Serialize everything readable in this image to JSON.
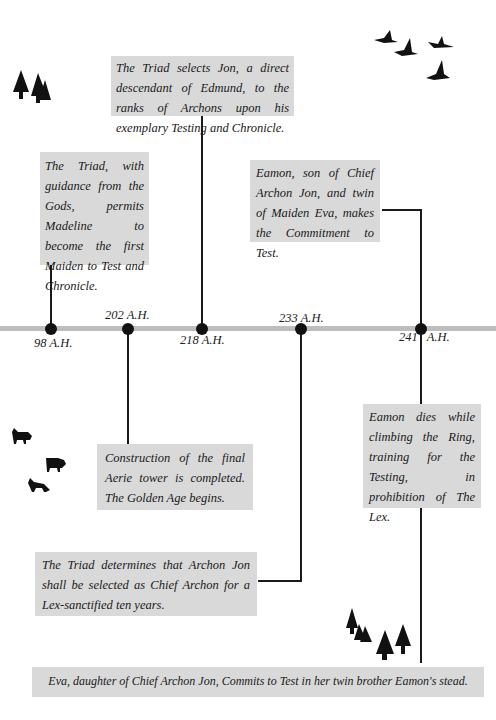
{
  "timeline": {
    "axis_color": "#bdbdbd",
    "box_color": "#d9d9d9",
    "dates": [
      {
        "label": "98 A.H.",
        "x": 51
      },
      {
        "label": "202 A.H.",
        "x": 128
      },
      {
        "label": "218 A.H.",
        "x": 202
      },
      {
        "label": "233 A.H.",
        "x": 301
      },
      {
        "label": "241 A.H.",
        "x": 421
      }
    ],
    "events": [
      {
        "date": "98 A.H.",
        "text": "The Triad, with guidance from the Gods, permits Madeline to become the first Maiden to Test and Chronicle."
      },
      {
        "date": "202 A.H.",
        "text": "Construction of the final Aerie tower is completed. The Golden Age begins."
      },
      {
        "date": "218 A.H.",
        "text": "The Triad selects Jon, a direct descendant of Edmund, to the ranks of Archons upon his exemplary Testing and Chronicle."
      },
      {
        "date": "233 A.H.",
        "text": "The Triad determines that Archon Jon shall be selected as Chief Archon for a Lex-sanctified ten years."
      },
      {
        "date": "241 A.H.",
        "text": "Eamon, son of Chief Archon Jon, and twin of Maiden Eva, makes the Commitment to Test."
      },
      {
        "date": "241 A.H.",
        "text": "Eamon dies while climbing the Ring, training for the Testing, in prohibition of The Lex."
      },
      {
        "date": "241 A.H.",
        "text": "Eva, daughter of Chief Archon Jon, Commits to Test in her twin brother Eamon's stead."
      }
    ]
  },
  "decorations": {
    "top_left": "trees-icon",
    "top_right": "flying-geese-icon",
    "middle_left": "wolves-icon",
    "bottom_right": "forest-icon"
  }
}
